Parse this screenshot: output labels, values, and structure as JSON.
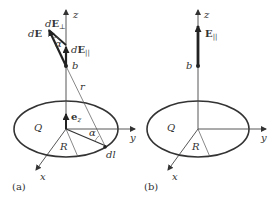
{
  "figure": {
    "panel_a": {
      "caption": "(a)",
      "axes": {
        "z": "z",
        "y": "y",
        "x": "x"
      },
      "labels": {
        "dE": "dE",
        "dE_perp_prefix": "d",
        "dE_perp_vec": "E",
        "dE_perp_sub": "⊥",
        "dE_par_prefix": "d",
        "dE_par_vec": "E",
        "dE_par_sub": "||",
        "alpha_top": "α",
        "alpha_bottom": "α",
        "b": "b",
        "r": "r",
        "ez_vec": "e",
        "ez_sub": "z",
        "Q": "Q",
        "R": "R",
        "dl": "dl"
      }
    },
    "panel_b": {
      "caption": "(b)",
      "axes": {
        "z": "z",
        "y": "y",
        "x": "x"
      },
      "labels": {
        "E_par_vec": "E",
        "E_par_sub": "||",
        "b": "b",
        "Q": "Q",
        "R": "R"
      }
    },
    "colors": {
      "ink": "#333333",
      "thin": "#555555",
      "background": "#ffffff"
    }
  }
}
